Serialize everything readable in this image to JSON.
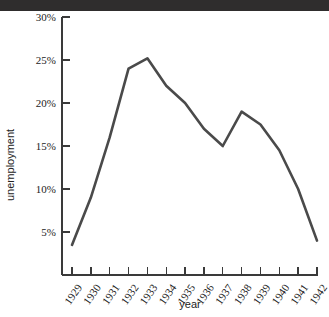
{
  "top_band": {
    "name": "cropped-title-band",
    "color": "#2f2d2d"
  },
  "chart_data": {
    "type": "line",
    "title": "",
    "subtitle": "",
    "xlabel": "year",
    "ylabel": "unemployment",
    "x": [
      1929,
      1930,
      1931,
      1932,
      1933,
      1934,
      1935,
      1936,
      1937,
      1938,
      1939,
      1940,
      1941,
      1942
    ],
    "categories": [
      "1929",
      "1930",
      "1931",
      "1932",
      "1933",
      "1934",
      "1935",
      "1936",
      "1937",
      "1938",
      "1939",
      "1940",
      "1941",
      "1942"
    ],
    "values": [
      3.5,
      9.0,
      16.0,
      24.0,
      25.2,
      22.0,
      20.0,
      17.0,
      15.0,
      19.0,
      17.5,
      14.5,
      10.0,
      4.0
    ],
    "series": [
      {
        "name": "unemployment",
        "values": [
          3.5,
          9.0,
          16.0,
          24.0,
          25.2,
          22.0,
          20.0,
          17.0,
          15.0,
          19.0,
          17.5,
          14.5,
          10.0,
          4.0
        ],
        "color": "#4a4a4a"
      }
    ],
    "ylim": [
      0,
      30
    ],
    "xlim": [
      1929,
      1942
    ],
    "ytick_labels": [
      "5%",
      "10%",
      "15%",
      "20%",
      "25%",
      "30%"
    ],
    "ytick_values": [
      5,
      10,
      15,
      20,
      25,
      30
    ],
    "xtick_labels": [
      "1929",
      "1930",
      "1931",
      "1932",
      "1933",
      "1934",
      "1935",
      "1936",
      "1937",
      "1938",
      "1939",
      "1940",
      "1941",
      "1942"
    ],
    "grid": false,
    "legend": false,
    "legend_position": "none",
    "line_color": "#4a4a4a",
    "axis_color": "#3a3a3a"
  }
}
